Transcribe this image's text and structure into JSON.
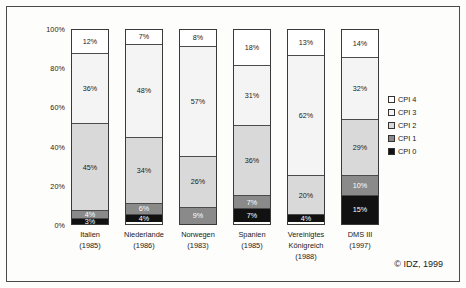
{
  "chart_data": {
    "type": "bar",
    "subtype": "stacked-100-percent",
    "title": "",
    "xlabel": "",
    "ylabel": "",
    "ylim": [
      0,
      100
    ],
    "ytick_labels": [
      "100%",
      "80%",
      "60%",
      "40%",
      "20%",
      "0%"
    ],
    "ytick_values": [
      100,
      80,
      60,
      40,
      20,
      0
    ],
    "grid": false,
    "legend_position": "right",
    "categories": [
      "Italien",
      "Niederlande",
      "Norwegen",
      "Spanien",
      "Vereinigtes Königreich",
      "DMS III"
    ],
    "category_lines": [
      [
        "Italien",
        "(1985)"
      ],
      [
        "Niederlande",
        "(1986)"
      ],
      [
        "Norwegen",
        "(1983)"
      ],
      [
        "Spanien",
        "(1985)"
      ],
      [
        "Vereinigtes",
        "Königreich",
        "(1988)"
      ],
      [
        "DMS III",
        "(1997)"
      ]
    ],
    "series": [
      {
        "name": "CPI 4",
        "color": "#ffffff",
        "values": [
          12,
          7,
          8,
          18,
          13,
          14
        ]
      },
      {
        "name": "CPI 3",
        "color": "#f4f4f4",
        "values": [
          36,
          48,
          57,
          31,
          62,
          32
        ]
      },
      {
        "name": "CPI 2",
        "color": "#d9d9d9",
        "values": [
          45,
          34,
          26,
          36,
          20,
          29
        ]
      },
      {
        "name": "CPI 1",
        "color": "#8a8a8a",
        "values": [
          4,
          6,
          9,
          7,
          0,
          10
        ]
      },
      {
        "name": "CPI 0",
        "color": "#111111",
        "values": [
          3,
          4,
          0,
          7,
          4,
          15
        ]
      }
    ],
    "bar_labels": [
      [
        "12%",
        "36%",
        "45%",
        "4%",
        "3%"
      ],
      [
        "7%",
        "48%",
        "34%",
        "6%",
        "4%"
      ],
      [
        "8%",
        "57%",
        "26%",
        "9%",
        ""
      ],
      [
        "18%",
        "31%",
        "36%",
        "7%",
        "7%"
      ],
      [
        "13%",
        "62%",
        "20%",
        "",
        "4%"
      ],
      [
        "14%",
        "32%",
        "29%",
        "10%",
        "15%"
      ]
    ]
  },
  "legend": {
    "items": [
      {
        "label": "CPI 4",
        "color": "#ffffff"
      },
      {
        "label": "CPI 3",
        "color": "#f4f4f4"
      },
      {
        "label": "CPI 2",
        "color": "#d9d9d9"
      },
      {
        "label": "CPI 1",
        "color": "#8a8a8a"
      },
      {
        "label": "CPI 0",
        "color": "#111111"
      }
    ]
  },
  "footer": {
    "copyright": "© IDZ, 1999"
  }
}
